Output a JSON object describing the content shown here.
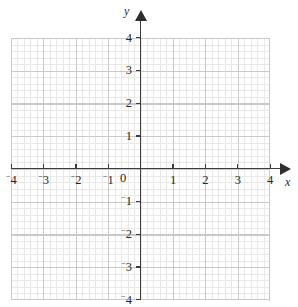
{
  "figure": {
    "kind": "cartesian-coordinate-grid",
    "axis_names": {
      "x": "x",
      "y": "y"
    },
    "origin_label": "0",
    "neg_sign": "⁻"
  },
  "chart_data": {
    "type": "scatter",
    "title": "",
    "subtitle": "",
    "xlabel": "x",
    "ylabel": "y",
    "xlim": [
      -4,
      4
    ],
    "ylim": [
      -4,
      4
    ],
    "grid": true,
    "minor_grid": true,
    "minor_ticks_per_unit": 5,
    "legend": "none",
    "series": [],
    "x_ticks": [
      {
        "value": -4,
        "label": "4",
        "negative": true
      },
      {
        "value": -3,
        "label": "3",
        "negative": true
      },
      {
        "value": -2,
        "label": "2",
        "negative": true
      },
      {
        "value": -1,
        "label": "1",
        "negative": true
      },
      {
        "value": 0,
        "label": "0",
        "negative": false
      },
      {
        "value": 1,
        "label": "1",
        "negative": false
      },
      {
        "value": 2,
        "label": "2",
        "negative": false
      },
      {
        "value": 3,
        "label": "3",
        "negative": false
      },
      {
        "value": 4,
        "label": "4",
        "negative": false
      }
    ],
    "y_ticks": [
      {
        "value": 4,
        "label": "4",
        "negative": false
      },
      {
        "value": 3,
        "label": "3",
        "negative": false
      },
      {
        "value": 2,
        "label": "2",
        "negative": false
      },
      {
        "value": 1,
        "label": "1",
        "negative": false
      },
      {
        "value": -1,
        "label": "1",
        "negative": true
      },
      {
        "value": -2,
        "label": "2",
        "negative": true
      },
      {
        "value": -3,
        "label": "3",
        "negative": true
      },
      {
        "value": -4,
        "label": "4",
        "negative": true
      }
    ],
    "colors": {
      "background": "#ffffff",
      "minor_grid": "#e9e9e9",
      "major_grid": "#c9c9c9",
      "axis": "#3c3c3c",
      "text": "#262626"
    }
  }
}
